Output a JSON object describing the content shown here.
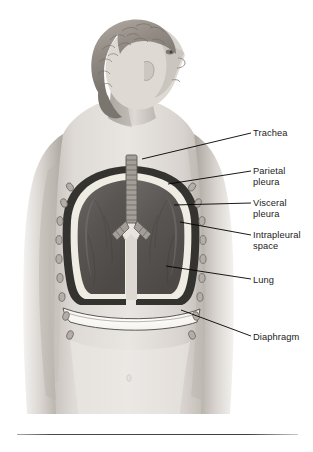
{
  "figure": {
    "view": "posterior view of a female torso with head turned to the right profile",
    "background_color": "#ffffff",
    "label_color": "#1b1b1b",
    "leader_line_color": "#000000",
    "skin_light": "#e9e6e2",
    "skin_mid": "#cfcac4",
    "skin_shadow": "#a9a39c",
    "hair_color": "#8e8880",
    "lung_color": "#5a5754",
    "parietal_pleura_color": "#3a3836",
    "intrapleural_color": "#efece4",
    "diaphragm_color": "#fbfaf6",
    "rib_color": "#8a8480",
    "trachea_color": "#9b9690"
  },
  "labels": [
    {
      "id": "trachea",
      "text": "Trachea",
      "x": 253,
      "y": 128,
      "leader": {
        "x1": 251,
        "y1": 133,
        "x2": 142,
        "y2": 159
      }
    },
    {
      "id": "parietal-pleura",
      "text": "Parietal\npleura",
      "x": 253,
      "y": 166,
      "leader": {
        "x1": 251,
        "y1": 171,
        "x2": 168,
        "y2": 184
      }
    },
    {
      "id": "visceral-pleura",
      "text": "Visceral\npleura",
      "x": 253,
      "y": 198,
      "leader": {
        "x1": 251,
        "y1": 203,
        "x2": 174,
        "y2": 205
      }
    },
    {
      "id": "intrapleural-space",
      "text": "Intrapleural\nspace",
      "x": 253,
      "y": 230,
      "leader": {
        "x1": 251,
        "y1": 235,
        "x2": 180,
        "y2": 222
      }
    },
    {
      "id": "lung",
      "text": "Lung",
      "x": 253,
      "y": 275,
      "leader": {
        "x1": 251,
        "y1": 279,
        "x2": 166,
        "y2": 266
      }
    },
    {
      "id": "diaphragm",
      "text": "Diaphragm",
      "x": 253,
      "y": 332,
      "leader": {
        "x1": 251,
        "y1": 336,
        "x2": 181,
        "y2": 310
      }
    }
  ],
  "anatomy_parts": [
    {
      "name": "head-hair",
      "description": "short curly hair"
    },
    {
      "name": "face-profile",
      "description": "face in right profile"
    },
    {
      "name": "neck",
      "description": "neck"
    },
    {
      "name": "left-arm",
      "description": "arm at figure's left side"
    },
    {
      "name": "right-arm",
      "description": "arm at figure's right side"
    },
    {
      "name": "torso",
      "description": "back torso with waist"
    },
    {
      "name": "trachea",
      "description": "trachea with cartilage rings"
    },
    {
      "name": "bronchi",
      "description": "primary bronchi branching at carina"
    },
    {
      "name": "right-lung",
      "description": "right lung"
    },
    {
      "name": "left-lung",
      "description": "left lung"
    },
    {
      "name": "ribs",
      "description": "rib cross sections along thoracic wall"
    },
    {
      "name": "diaphragm",
      "description": "diaphragm band below lungs"
    },
    {
      "name": "navel",
      "description": "navel"
    }
  ],
  "bottom_rule": {
    "visible": true
  }
}
